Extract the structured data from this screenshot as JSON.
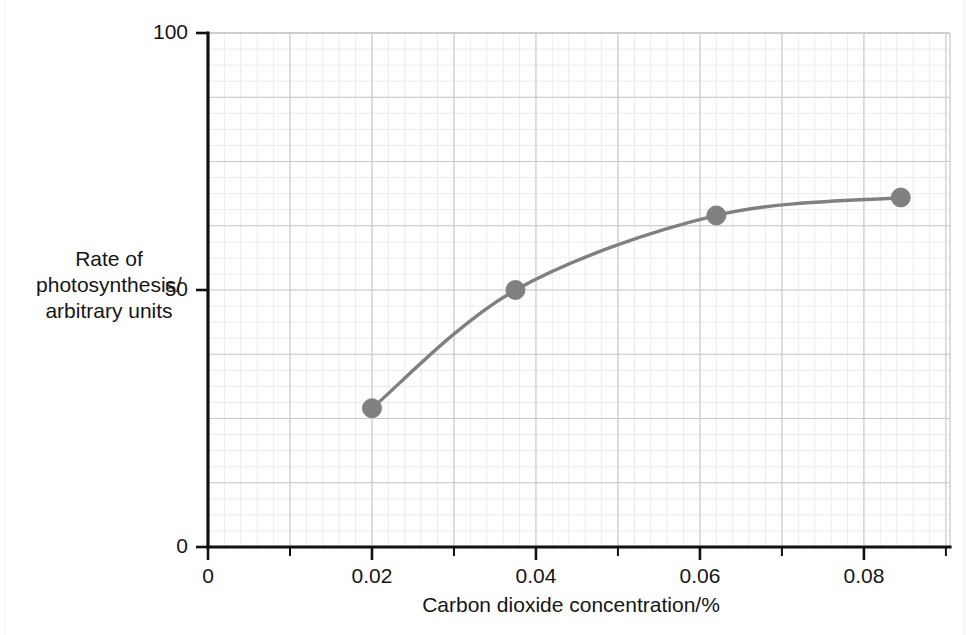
{
  "chart_data": {
    "type": "line",
    "title": "",
    "subtitle": "",
    "xlabel": "Carbon dioxide concentration/%",
    "ylabel": "Rate of photosynthesis/ arbitrary units",
    "ylabel_lines": [
      "Rate of",
      "photosynthesis/",
      "arbitrary units"
    ],
    "xlim": [
      0,
      0.0905
    ],
    "ylim": [
      0,
      100
    ],
    "x_major_ticks": [
      0,
      0.02,
      0.04,
      0.06,
      0.08
    ],
    "x_major_tick_labels": [
      "0",
      "0.02",
      "0.04",
      "0.06",
      "0.08"
    ],
    "x_minor_ticks": [
      0.01,
      0.03,
      0.05,
      0.07,
      0.09
    ],
    "y_major_ticks": [
      0,
      50,
      100
    ],
    "y_major_tick_labels": [
      "0",
      "50",
      "100"
    ],
    "y_gridlines": [
      0,
      12.5,
      25,
      37.5,
      50,
      62.5,
      75,
      87.5,
      100
    ],
    "grid": true,
    "legend": "none",
    "series": [
      {
        "name": "Rate of photosynthesis",
        "marker": "filled-circle",
        "color": "#808080",
        "x": [
          0.02,
          0.0375,
          0.062,
          0.0845
        ],
        "values": [
          27,
          50,
          64.5,
          68
        ],
        "points": [
          {
            "x": 0.02,
            "y": 27
          },
          {
            "x": 0.0375,
            "y": 50
          },
          {
            "x": 0.062,
            "y": 64.5
          },
          {
            "x": 0.0845,
            "y": 68
          }
        ]
      }
    ],
    "colors": {
      "curve": "#808080",
      "marker": "#808080",
      "axis": "#111111",
      "grid_major": "#c9c9c9",
      "grid_minor": "#ececec",
      "background": "#ffffff",
      "text": "#151515"
    }
  },
  "annotations": {
    "origin_y_label": "0",
    "origin_x_label": "0"
  }
}
